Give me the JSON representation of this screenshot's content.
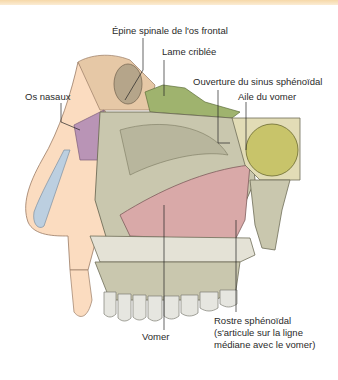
{
  "figure": {
    "labels": {
      "epine_spinale": "Épine spinale de l'os frontal",
      "lame_criblee": "Lame criblée",
      "ouverture_sinus": "Ouverture du sinus sphénoïdal",
      "os_nasaux": "Os nasaux",
      "aile_vomer": "Aile du vomer",
      "vomer": "Vomer",
      "rostre_line1": "Rostre sphénoïdal",
      "rostre_line2": "(s'articule sur la ligne",
      "rostre_line3": "médiane avec le vomer)"
    },
    "colors": {
      "header_bar": "#f6d8a8",
      "bone": "#c9c7ae",
      "bone_dark": "#a9a78c",
      "vomer_pink": "#d9a9a8",
      "nasal_purple": "#b994b6",
      "cartilage": "#bccfe0",
      "skin": "#fbdcc0",
      "cribriform_green": "#9fb36e",
      "sinus_olive": "#c8c46a",
      "teeth": "#e6e6e0"
    }
  }
}
